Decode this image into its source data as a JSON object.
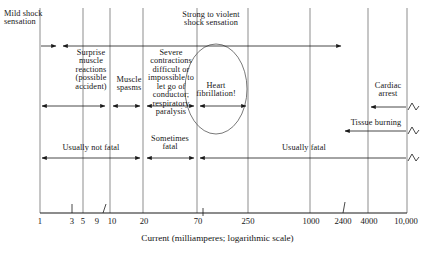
{
  "figure": {
    "type": "annotated-number-line-diagram",
    "axis": {
      "label": "Current (milliamperes; logarithmic scale)",
      "scale": "logarithmic",
      "min": 1,
      "max": 10000,
      "ticks": [
        {
          "value": 1,
          "label": "1",
          "gridline": true
        },
        {
          "value": 3,
          "label": "3",
          "gridline": false
        },
        {
          "value": 5,
          "label": "5",
          "gridline": true
        },
        {
          "value": 9,
          "label": "9",
          "gridline": false
        },
        {
          "value": 10,
          "label": "10",
          "gridline": true
        },
        {
          "value": 20,
          "label": "20",
          "gridline": true
        },
        {
          "value": 70,
          "label": "70",
          "gridline": true
        },
        {
          "value": 250,
          "label": "250",
          "gridline": true
        },
        {
          "value": 1000,
          "label": "1000",
          "gridline": true
        },
        {
          "value": 2400,
          "label": "2400",
          "gridline": false
        },
        {
          "value": 4000,
          "label": "4000",
          "gridline": true
        },
        {
          "value": 10000,
          "label": "10,000",
          "gridline": true
        }
      ]
    },
    "effect_labels": [
      {
        "id": "mild-shock",
        "text": "Mild shock\nsensation",
        "range": [
          1,
          5
        ]
      },
      {
        "id": "surprise-muscle",
        "text": "Surprise\nmuscle\nreactions\n(possible\naccident)",
        "range": [
          5,
          10
        ]
      },
      {
        "id": "muscle-spasms",
        "text": "Muscle\nspasms",
        "range": [
          10,
          20
        ]
      },
      {
        "id": "severe-contractions",
        "text": "Severe\ncontractions\ndifficult or\nimpossible to\nlet go of\nconductor;\nrespiratory\nparalysis",
        "range": [
          20,
          70
        ]
      },
      {
        "id": "strong-violent",
        "text": "Strong to violent\nshock sensation",
        "range": [
          70,
          2400
        ]
      },
      {
        "id": "heart-fibrillation",
        "text": "Heart\nfibrillation!",
        "range": [
          70,
          250
        ],
        "circled": true
      },
      {
        "id": "cardiac-arrest",
        "text": "Cardiac\narrest",
        "range": [
          4000,
          10000
        ]
      },
      {
        "id": "tissue-burning",
        "text": "Tissue burning",
        "range": [
          2400,
          10000
        ]
      }
    ],
    "outcome_labels": [
      {
        "id": "usually-not-fatal",
        "text": "Usually not fatal",
        "range": [
          1,
          20
        ]
      },
      {
        "id": "sometimes-fatal",
        "text": "Sometimes\nfatal",
        "range": [
          20,
          70
        ]
      },
      {
        "id": "usually-fatal",
        "text": "Usually fatal",
        "range": [
          70,
          10000
        ]
      }
    ]
  }
}
